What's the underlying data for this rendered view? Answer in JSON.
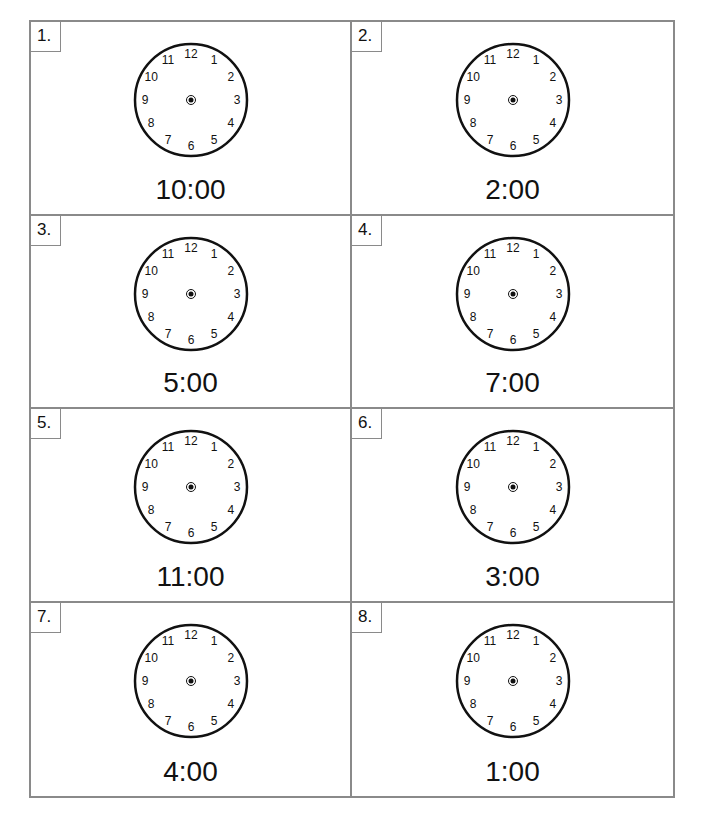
{
  "worksheet": {
    "clock_numerals": [
      "12",
      "1",
      "2",
      "3",
      "4",
      "5",
      "6",
      "7",
      "8",
      "9",
      "10",
      "11"
    ],
    "items": [
      {
        "number": "1.",
        "time": "10:00"
      },
      {
        "number": "2.",
        "time": "2:00"
      },
      {
        "number": "3.",
        "time": "5:00"
      },
      {
        "number": "4.",
        "time": "7:00"
      },
      {
        "number": "5.",
        "time": "11:00"
      },
      {
        "number": "6.",
        "time": "3:00"
      },
      {
        "number": "7.",
        "time": "4:00"
      },
      {
        "number": "8.",
        "time": "1:00"
      }
    ]
  }
}
